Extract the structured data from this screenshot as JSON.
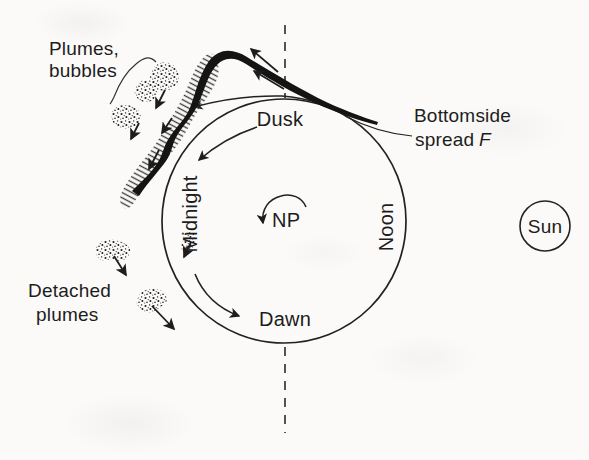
{
  "colors": {
    "background": "#fbfaf8",
    "ink": "#1d1d1d"
  },
  "labels": {
    "plumes_line1": "Plumes,",
    "plumes_line2": "bubbles",
    "dusk": "Dusk",
    "midnight": "Midnight",
    "noon": "Noon",
    "dawn": "Dawn",
    "np": "NP",
    "sun": "Sun",
    "bottomside_line1": "Bottomside",
    "bottomside_line2_word": "spread",
    "bottomside_line2_f": "F",
    "detached_line1": "Detached",
    "detached_line2": "plumes"
  }
}
